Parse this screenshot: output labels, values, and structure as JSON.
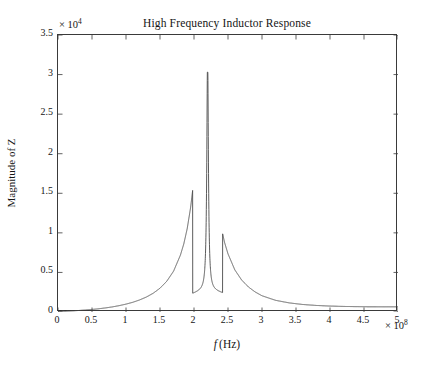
{
  "chart_data": {
    "type": "line",
    "title": "High Frequency Inductor Response",
    "xlabel": "f (Hz)",
    "xlabel_italic_part": "f",
    "xlabel_rest": "(Hz)",
    "ylabel": "Magnitude of Z",
    "x_exponent_mantissa": "× 10",
    "x_exponent_power": "8",
    "y_exponent_mantissa": "× 10",
    "y_exponent_power": "4",
    "xlim": [
      0,
      5
    ],
    "ylim": [
      0,
      3.5
    ],
    "x_unit_scale": 100000000.0,
    "y_unit_scale": 10000.0,
    "grid": false,
    "legend": "none",
    "line_color": "#4a4a4a",
    "frame_color": "#3a3a3a",
    "background_color": "#ffffff",
    "xticks": [
      0,
      0.5,
      1,
      1.5,
      2,
      2.5,
      3,
      3.5,
      4,
      4.5,
      5
    ],
    "xtick_labels": [
      "0",
      "0.5",
      "1",
      "1.5",
      "2",
      "2.5",
      "3",
      "3.5",
      "4",
      "4.5",
      "5"
    ],
    "yticks": [
      0,
      0.5,
      1,
      1.5,
      2,
      2.5,
      3,
      3.5
    ],
    "ytick_labels": [
      "0",
      "0.5",
      "1",
      "1.5",
      "2",
      "2.5",
      "3",
      "3.5"
    ],
    "resonance": {
      "peak_x": 2.2,
      "peak_y": 3.03,
      "half_width": 0.0135,
      "baseline_left": 0.01,
      "baseline_right": 0.045
    },
    "series": [
      {
        "name": "Magnitude of Z",
        "x": [
          0.0,
          0.1,
          0.2,
          0.3,
          0.4,
          0.5,
          0.6,
          0.7,
          0.8,
          0.9,
          1.0,
          1.1,
          1.2,
          1.3,
          1.4,
          1.5,
          1.6,
          1.7,
          1.8,
          1.85,
          1.9,
          1.95,
          2.0,
          2.05,
          2.1,
          2.13,
          2.16,
          2.18,
          2.19,
          2.195,
          2.2,
          2.205,
          2.21,
          2.22,
          2.24,
          2.27,
          2.3,
          2.35,
          2.4,
          2.45,
          2.5,
          2.6,
          2.7,
          2.8,
          2.9,
          3.0,
          3.2,
          3.4,
          3.6,
          3.8,
          4.0,
          4.2,
          4.4,
          4.6,
          4.8,
          5.0
        ],
        "y": [
          0.002,
          0.005,
          0.011,
          0.018,
          0.026,
          0.036,
          0.048,
          0.063,
          0.081,
          0.103,
          0.13,
          0.163,
          0.205,
          0.258,
          0.327,
          0.42,
          0.55,
          0.742,
          1.05,
          1.27,
          1.57,
          1.99,
          2.56,
          2.96,
          2.95,
          2.99,
          3.01,
          3.022,
          3.027,
          3.029,
          3.03,
          3.028,
          3.024,
          3.01,
          2.96,
          2.83,
          2.56,
          1.99,
          1.57,
          1.27,
          1.05,
          0.742,
          0.55,
          0.42,
          0.327,
          0.258,
          0.175,
          0.128,
          0.098,
          0.079,
          0.066,
          0.057,
          0.05,
          0.045,
          0.041,
          0.038
        ],
        "note": "Lorentzian-like resonance of a high frequency inductor model; magnitude in units of 1e4 ohms, frequency in units of 1e8 Hz"
      }
    ]
  },
  "figure": {
    "title": "High Frequency Inductor Response"
  }
}
